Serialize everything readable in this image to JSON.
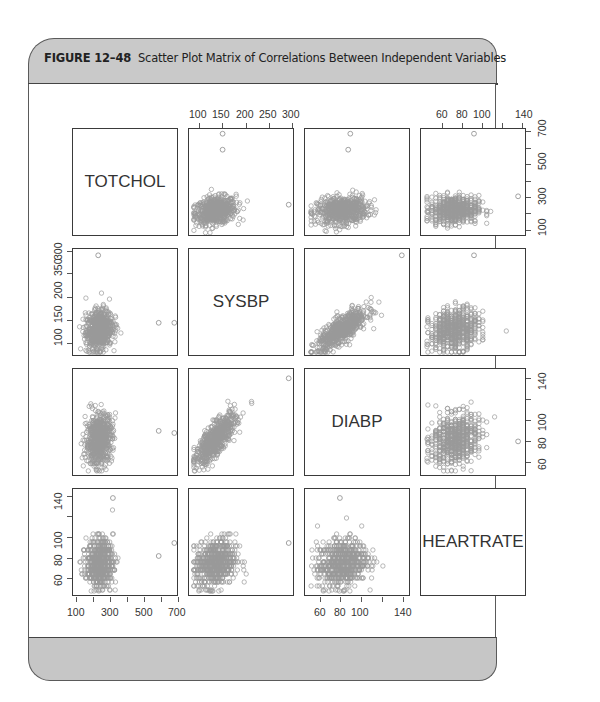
{
  "figure": {
    "label": "FIGURE 12–48",
    "caption": "Scatter Plot Matrix of Correlations Between Independent Variables"
  },
  "colors": {
    "header_band": "#c9c9c9",
    "footer_band": "#c6c6c6",
    "frame_border": "#5a5a5a",
    "points": "#9a9a9a",
    "panel_border": "#3a3a3a"
  },
  "axes": {
    "top_col2": [
      "100",
      "150",
      "200",
      "250",
      "300"
    ],
    "top_col4": [
      "60",
      "80",
      "100",
      "140"
    ],
    "right_row1": [
      "100",
      "300",
      "500",
      "700"
    ],
    "left_row2": [
      "100",
      "150",
      "200",
      "350",
      "300"
    ],
    "right_row3": [
      "60",
      "80",
      "100",
      "140"
    ],
    "left_row4": [
      "60",
      "80",
      "100",
      "140"
    ],
    "bottom_col1": [
      "100",
      "300",
      "500",
      "700"
    ],
    "bottom_col3": [
      "60",
      "80",
      "100",
      "140"
    ]
  },
  "chart_data": {
    "type": "scatter",
    "subtitle": "",
    "layout": "scatterplot matrix 4x4",
    "variables": [
      "TOTCHOL",
      "SYSBP",
      "DIABP",
      "HEARTRATE"
    ],
    "diagonal_labels": [
      "TOTCHOL",
      "SYSBP",
      "DIABP",
      "HEARTRATE"
    ],
    "ranges": {
      "TOTCHOL": [
        100,
        700
      ],
      "SYSBP": [
        85,
        300
      ],
      "DIABP": [
        50,
        145
      ],
      "HEARTRATE": [
        45,
        145
      ]
    },
    "tick_labels": {
      "TOTCHOL": [
        "100",
        "300",
        "500",
        "700"
      ],
      "SYSBP_top": [
        "100",
        "150",
        "200",
        "250",
        "300"
      ],
      "SYSBP_left": [
        "100",
        "150",
        "200",
        "350",
        "300"
      ],
      "DIABP": [
        "60",
        "80",
        "100",
        "140"
      ],
      "HEARTRATE": [
        "60",
        "80",
        "100",
        "140"
      ]
    },
    "pairs": [
      {
        "x": "SYSBP",
        "y": "TOTCHOL",
        "correlation": "weak positive",
        "cluster_center": [
          135,
          235
        ],
        "outliers": [
          [
            150,
            696
          ],
          [
            150,
            600
          ],
          [
            295,
            270
          ]
        ]
      },
      {
        "x": "DIABP",
        "y": "TOTCHOL",
        "correlation": "weak positive",
        "cluster_center": [
          82,
          235
        ],
        "outliers": [
          [
            90,
            696
          ],
          [
            88,
            600
          ]
        ]
      },
      {
        "x": "HEARTRATE",
        "y": "TOTCHOL",
        "correlation": "none",
        "cluster_center": [
          75,
          240
        ],
        "outliers": [
          [
            95,
            696
          ],
          [
            140,
            320
          ]
        ]
      },
      {
        "x": "TOTCHOL",
        "y": "SYSBP",
        "correlation": "weak positive",
        "cluster_center": [
          235,
          135
        ],
        "outliers": [
          [
            230,
            295
          ],
          [
            600,
            150
          ],
          [
            696,
            150
          ]
        ]
      },
      {
        "x": "DIABP",
        "y": "SYSBP",
        "correlation": "strong positive",
        "cluster_center": [
          82,
          135
        ],
        "outliers": [
          [
            140,
            295
          ]
        ]
      },
      {
        "x": "HEARTRATE",
        "y": "SYSBP",
        "correlation": "weak positive",
        "cluster_center": [
          75,
          135
        ],
        "outliers": [
          [
            95,
            295
          ]
        ]
      },
      {
        "x": "TOTCHOL",
        "y": "DIABP",
        "correlation": "weak positive",
        "cluster_center": [
          235,
          82
        ],
        "outliers": [
          [
            600,
            90
          ],
          [
            696,
            88
          ]
        ]
      },
      {
        "x": "SYSBP",
        "y": "DIABP",
        "correlation": "strong positive",
        "cluster_center": [
          135,
          82
        ],
        "outliers": [
          [
            295,
            140
          ]
        ]
      },
      {
        "x": "HEARTRATE",
        "y": "DIABP",
        "correlation": "weak positive",
        "cluster_center": [
          75,
          82
        ],
        "outliers": [
          [
            140,
            80
          ]
        ]
      },
      {
        "x": "TOTCHOL",
        "y": "HEARTRATE",
        "correlation": "none",
        "cluster_center": [
          240,
          75
        ],
        "outliers": [
          [
            320,
            140
          ],
          [
            696,
            95
          ],
          [
            600,
            82
          ]
        ]
      },
      {
        "x": "SYSBP",
        "y": "HEARTRATE",
        "correlation": "weak positive",
        "cluster_center": [
          135,
          75
        ],
        "outliers": [
          [
            295,
            95
          ]
        ]
      },
      {
        "x": "DIABP",
        "y": "HEARTRATE",
        "correlation": "weak positive",
        "cluster_center": [
          82,
          75
        ],
        "outliers": [
          [
            80,
            140
          ]
        ]
      }
    ],
    "grid": false,
    "legend": null,
    "marker": "open circle"
  }
}
